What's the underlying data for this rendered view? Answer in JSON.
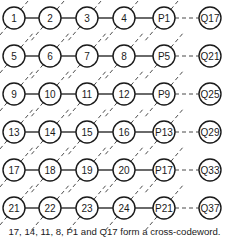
{
  "diagram": {
    "type": "code-lattice",
    "rows": [
      {
        "data": [
          "1",
          "2",
          "3",
          "4"
        ],
        "parity": "P1",
        "check": "Q17"
      },
      {
        "data": [
          "5",
          "6",
          "7",
          "8"
        ],
        "parity": "P5",
        "check": "Q21"
      },
      {
        "data": [
          "9",
          "10",
          "11",
          "12"
        ],
        "parity": "P9",
        "check": "Q25"
      },
      {
        "data": [
          "13",
          "14",
          "15",
          "16"
        ],
        "parity": "P13",
        "check": "Q29"
      },
      {
        "data": [
          "17",
          "18",
          "19",
          "20"
        ],
        "parity": "P17",
        "check": "Q33"
      },
      {
        "data": [
          "21",
          "22",
          "23",
          "24"
        ],
        "parity": "P21",
        "check": "Q37"
      }
    ],
    "column_x": [
      14,
      50,
      87,
      124,
      164,
      210
    ],
    "row_y": [
      18,
      56,
      94,
      132,
      170,
      208
    ],
    "node_radius": 11,
    "edges": {
      "solid_horizontal": "between data nodes and parity node in each row",
      "dashed_horizontal": "between parity node and check node",
      "dashed_diagonal": "anti-diagonals linking nodes down-left to up-right"
    },
    "caption": "17, 14, 11, 8, P1 and Q17 form a  cross-codeword."
  },
  "colors": {
    "stroke": "#1a1a1a",
    "background": "#ffffff"
  }
}
